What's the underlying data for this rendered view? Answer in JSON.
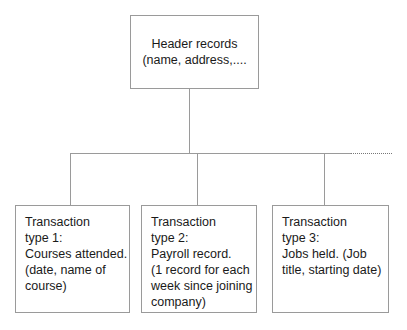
{
  "diagram": {
    "header": {
      "lines": [
        "Header records",
        "(name, address,...."
      ]
    },
    "transactions": [
      {
        "lines": [
          "Transaction",
          "type 1:",
          "Courses attended.",
          "(date, name of",
          "course)"
        ]
      },
      {
        "lines": [
          "Transaction",
          "type 2:",
          "Payroll record.",
          "(1 record for each",
          "week since joining",
          "company)"
        ]
      },
      {
        "lines": [
          "Transaction",
          "type 3:",
          "Jobs held. (Job",
          "title, starting date)"
        ]
      }
    ],
    "continuation": "dotted-line-more-types",
    "colors": {
      "line": "#9a9a9a",
      "text": "#1a1a1a",
      "background": "#ffffff"
    }
  }
}
